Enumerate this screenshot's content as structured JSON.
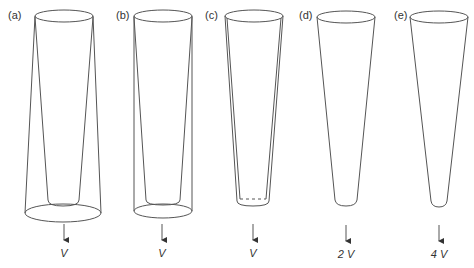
{
  "figure": {
    "stroke_color": "#555555",
    "panels": [
      {
        "id": "a",
        "label": "(a)",
        "flow": "V",
        "type": "cylinder-with-inner-tapered-rod"
      },
      {
        "id": "b",
        "label": "(b)",
        "flow": "V",
        "type": "cylinder-with-inner-tapered-rod"
      },
      {
        "id": "c",
        "label": "(c)",
        "flow": "V",
        "type": "double-walled-taper"
      },
      {
        "id": "d",
        "label": "(d)",
        "flow": "2 V",
        "type": "tapered-tube"
      },
      {
        "id": "e",
        "label": "(e)",
        "flow": "4 V",
        "type": "tapered-tube"
      }
    ]
  }
}
